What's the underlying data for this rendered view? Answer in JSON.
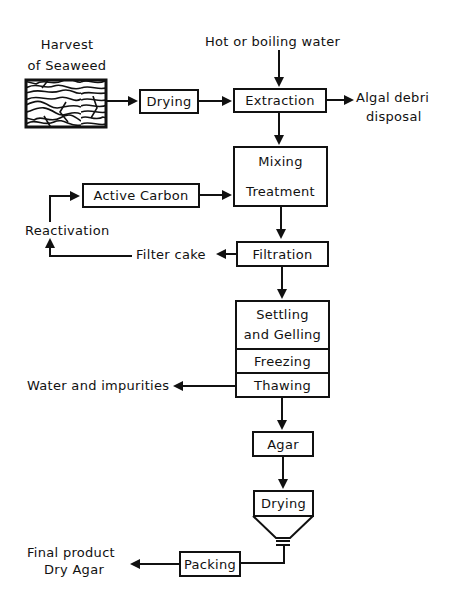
{
  "diagram": {
    "type": "process-flowchart",
    "inputs": {
      "harvest_line1": "Harvest",
      "harvest_line2": "of Seaweed",
      "water": "Hot or boiling water"
    },
    "steps": {
      "drying1": "Drying",
      "extraction": "Extraction",
      "mixing": "Mixing",
      "treatment": "Treatment",
      "active_carbon": "Active Carbon",
      "filtration": "Filtration",
      "settling_line1": "Settling",
      "settling_line2": "and Gelling",
      "freezing": "Freezing",
      "thawing": "Thawing",
      "agar": "Agar",
      "drying2": "Drying",
      "packing": "Packing"
    },
    "outputs": {
      "algal_line1": "Algal debri",
      "algal_line2": "disposal",
      "filter_cake": "Filter cake",
      "reactivation": "Reactivation",
      "water_impurities": "Water and impurities",
      "final_line1": "Final product",
      "final_line2": "Dry Agar"
    },
    "edges": [
      [
        "Harvest of Seaweed",
        "Drying"
      ],
      [
        "Drying",
        "Extraction"
      ],
      [
        "Hot or boiling water",
        "Extraction"
      ],
      [
        "Extraction",
        "Algal debri disposal"
      ],
      [
        "Extraction",
        "Mixing/Treatment"
      ],
      [
        "Active Carbon",
        "Mixing/Treatment"
      ],
      [
        "Mixing/Treatment",
        "Filtration"
      ],
      [
        "Filtration",
        "Filter cake"
      ],
      [
        "Filter cake",
        "Reactivation"
      ],
      [
        "Reactivation",
        "Active Carbon"
      ],
      [
        "Filtration",
        "Settling and Gelling"
      ],
      [
        "Thawing",
        "Water and impurities"
      ],
      [
        "Thawing",
        "Agar"
      ],
      [
        "Agar",
        "Drying"
      ],
      [
        "Drying",
        "Packing"
      ],
      [
        "Packing",
        "Final product Dry Agar"
      ]
    ]
  }
}
